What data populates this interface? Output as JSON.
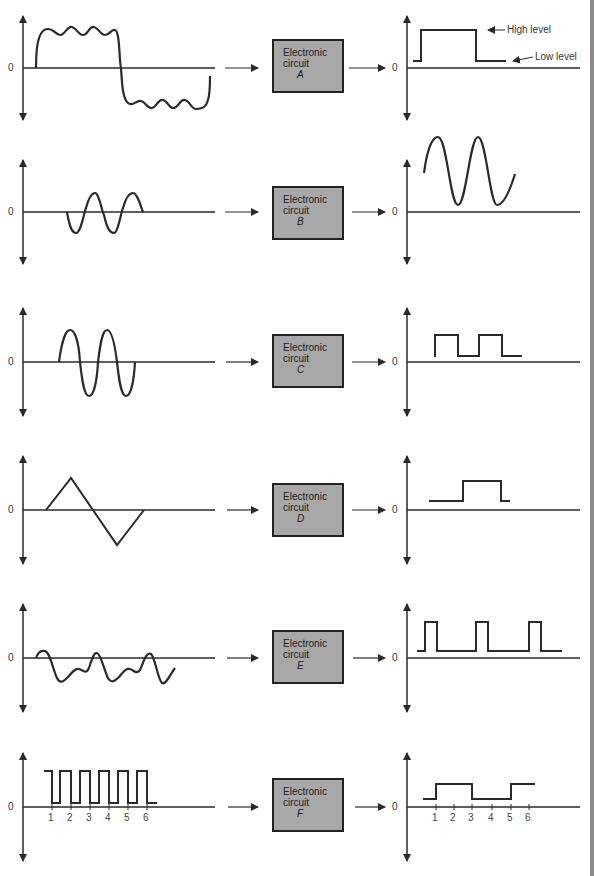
{
  "figure": {
    "box_label_line1": "Electronic",
    "box_label_line2": "circuit",
    "zero_label": "0",
    "annotations": {
      "high_level": "High level",
      "low_level": "Low level"
    },
    "colors": {
      "box_fill": "#a8a8a8",
      "line": "#2a2a2a",
      "edge_bar": "#8c8c8c"
    }
  },
  "rows": [
    {
      "circuit": "A",
      "input": "noisy square wave",
      "output": "single high pulse then low level"
    },
    {
      "circuit": "B",
      "input": "small sine burst",
      "output": "amplified offset sine"
    },
    {
      "circuit": "C",
      "input": "sine burst (2 cycles)",
      "output": "two pulses"
    },
    {
      "circuit": "D",
      "input": "triangle wave (1 cycle)",
      "output": "one pulse"
    },
    {
      "circuit": "E",
      "input": "irregular noisy wave",
      "output": "three periodic pulses"
    },
    {
      "circuit": "F",
      "input": "6-cycle square pulse train",
      "output": "frequency-divided square wave"
    }
  ],
  "ticks_f_input": [
    "1",
    "2",
    "3",
    "4",
    "5",
    "6"
  ],
  "ticks_f_output": [
    "1",
    "2",
    "3",
    "4",
    "5",
    "6"
  ]
}
